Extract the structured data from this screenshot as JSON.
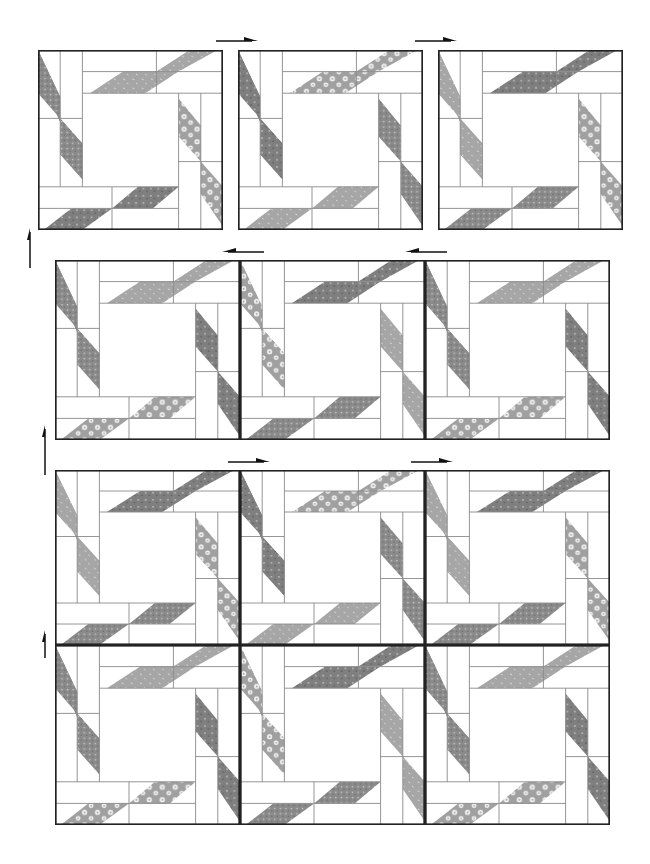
{
  "diagram": {
    "colors": {
      "background": "#ffffff",
      "line": "#8a8a8a",
      "border": "#222222",
      "fabric_dark": "#8f8f8f",
      "fabric_medium": "#a9a9a9",
      "fabric_floral": "#9e9e9e",
      "fabric_light_flower": "#f2f2f2"
    },
    "groups": [
      {
        "name": "row-1-separate-blocks",
        "blocks": [
          {
            "x": 38,
            "y": 50,
            "w": 185,
            "h": 180,
            "fabrics": {
              "top": "medium",
              "left": "dark-speckle",
              "right": "floral",
              "bottom": "dark"
            }
          },
          {
            "x": 238,
            "y": 50,
            "w": 185,
            "h": 180,
            "fabrics": {
              "top": "floral",
              "left": "dark",
              "right": "dark-speckle",
              "bottom": "medium"
            }
          },
          {
            "x": 438,
            "y": 50,
            "w": 185,
            "h": 180,
            "fabrics": {
              "top": "dark",
              "left": "medium",
              "right": "floral",
              "bottom": "dark-speckle"
            }
          }
        ],
        "arrows": [
          {
            "x": 216,
            "y": 40,
            "dir": "right"
          },
          {
            "x": 415,
            "y": 40,
            "dir": "right"
          }
        ]
      },
      {
        "name": "row-2-joined",
        "blocks": [
          {
            "x": 55,
            "y": 260,
            "w": 185,
            "h": 180,
            "fabrics": {
              "top": "medium",
              "left": "dark-speckle",
              "right": "dark",
              "bottom": "floral"
            }
          },
          {
            "x": 240,
            "y": 260,
            "w": 185,
            "h": 180,
            "fabrics": {
              "top": "dark",
              "left": "floral",
              "right": "medium",
              "bottom": "dark-speckle"
            }
          },
          {
            "x": 425,
            "y": 260,
            "w": 185,
            "h": 180,
            "fabrics": {
              "top": "medium",
              "left": "dark-speckle",
              "right": "dark",
              "bottom": "floral"
            }
          }
        ],
        "arrows": [
          {
            "x": 222,
            "y": 251,
            "dir": "left"
          },
          {
            "x": 405,
            "y": 251,
            "dir": "left"
          }
        ]
      },
      {
        "name": "row-3-joined",
        "blocks": [
          {
            "x": 55,
            "y": 470,
            "w": 185,
            "h": 175,
            "fabrics": {
              "top": "dark",
              "left": "medium",
              "right": "floral",
              "bottom": "dark-speckle"
            }
          },
          {
            "x": 240,
            "y": 470,
            "w": 185,
            "h": 175,
            "fabrics": {
              "top": "floral",
              "left": "dark",
              "right": "dark-speckle",
              "bottom": "medium"
            }
          },
          {
            "x": 425,
            "y": 470,
            "w": 185,
            "h": 175,
            "fabrics": {
              "top": "dark",
              "left": "medium",
              "right": "floral",
              "bottom": "dark-speckle"
            }
          }
        ],
        "arrows": [
          {
            "x": 228,
            "y": 461,
            "dir": "right"
          },
          {
            "x": 411,
            "y": 461,
            "dir": "right"
          }
        ]
      },
      {
        "name": "row-4-joined",
        "blocks": [
          {
            "x": 55,
            "y": 645,
            "w": 185,
            "h": 180,
            "fabrics": {
              "top": "medium",
              "left": "dark-speckle",
              "right": "dark",
              "bottom": "floral"
            }
          },
          {
            "x": 240,
            "y": 645,
            "w": 185,
            "h": 180,
            "fabrics": {
              "top": "dark",
              "left": "floral",
              "right": "medium",
              "bottom": "dark-speckle"
            }
          },
          {
            "x": 425,
            "y": 645,
            "w": 185,
            "h": 180,
            "fabrics": {
              "top": "medium",
              "left": "dark-speckle",
              "right": "dark",
              "bottom": "floral"
            }
          }
        ],
        "arrows": []
      }
    ],
    "side_arrows": [
      {
        "x": 30,
        "y1": 268,
        "y2": 228,
        "dir": "up"
      },
      {
        "x": 45,
        "y1": 475,
        "y2": 425,
        "dir": "up"
      },
      {
        "x": 45,
        "y1": 658,
        "y2": 630,
        "dir": "up"
      }
    ]
  }
}
